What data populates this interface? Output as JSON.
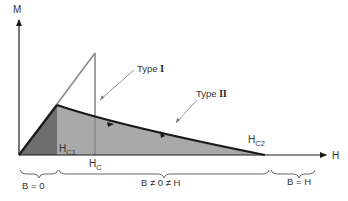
{
  "diagram": {
    "type": "magnetization vs applied field for superconductors",
    "axes": {
      "y_label": "M",
      "x_label": "H"
    },
    "curves": [
      {
        "name": "Type I",
        "label_main": "Type ",
        "label_roman": "I",
        "description": "linear rise then abrupt drop at H_C"
      },
      {
        "name": "Type II",
        "label_main": "Type ",
        "label_roman": "II",
        "description": "linear rise to H_C1 then gradual decline to H_C2"
      }
    ],
    "field_markers": {
      "hc1": {
        "base": "H",
        "sub": "C1"
      },
      "hc": {
        "base": "H",
        "sub": "C"
      },
      "hc2": {
        "base": "H",
        "sub": "C2"
      }
    },
    "regions": [
      {
        "label": "B = 0"
      },
      {
        "label": "B ≠ 0 ≠ H"
      },
      {
        "label": "B = H"
      }
    ],
    "colors": {
      "line": "#1a1a1a",
      "dark_fill": "#6e6e6e",
      "light_fill": "#a9a9a9",
      "type1_line": "#888888",
      "pointer": "#777777",
      "text": "#333333"
    }
  }
}
